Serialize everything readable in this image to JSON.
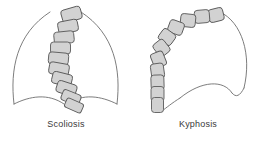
{
  "figure": {
    "type": "medical-illustration",
    "background_color": "#ffffff",
    "outline_color": "#6e6e6e",
    "vertebra_fill_color": "#d2d2d2",
    "vertebra_stroke_color": "#5a5a5a",
    "label_color": "#3a3a3a"
  },
  "panels": [
    {
      "id": "scoliosis",
      "label": "Scoliosis",
      "view": "anterior",
      "description": "Rib cage outline with lateral S-shaped curvature of the spine",
      "vertebra_count": 12,
      "body_outline_paths": [
        "M 14 104 C 10 70, 16 34, 50 12",
        "M 117 104 C 121 70, 115 34, 81 12",
        "M 14 104 C 30 96, 48 93, 64 104",
        "M 117 104 C 101 96, 83 93, 67 104"
      ],
      "vertebrae": [
        {
          "cx": 71.5,
          "cy": 14.5,
          "w": 20,
          "h": 13,
          "rot": -16
        },
        {
          "cx": 68.0,
          "cy": 26.5,
          "w": 20,
          "h": 12,
          "rot": -11
        },
        {
          "cx": 64.0,
          "cy": 37.5,
          "w": 20,
          "h": 12,
          "rot": -6
        },
        {
          "cx": 60.5,
          "cy": 48.0,
          "w": 20,
          "h": 12,
          "rot": 0
        },
        {
          "cx": 58.5,
          "cy": 58.5,
          "w": 20,
          "h": 12,
          "rot": 5
        },
        {
          "cx": 59.0,
          "cy": 69.0,
          "w": 20,
          "h": 12,
          "rot": 10
        },
        {
          "cx": 62.0,
          "cy": 79.0,
          "w": 20,
          "h": 12,
          "rot": 14
        },
        {
          "cx": 66.5,
          "cy": 88.5,
          "w": 20,
          "h": 12,
          "rot": 18
        },
        {
          "cx": 71.0,
          "cy": 97.5,
          "w": 19,
          "h": 11,
          "rot": 22
        },
        {
          "cx": 74.0,
          "cy": 105.5,
          "w": 18,
          "h": 10,
          "rot": 24
        }
      ]
    },
    {
      "id": "kyphosis",
      "label": "Kyphosis",
      "view": "lateral",
      "description": "Side view of torso with exaggerated forward rounding of the upper spine",
      "vertebra_count": 12,
      "body_outline_paths": [
        "M 88 12 C 110 22, 120 55, 112 88",
        "M 112 88 C 108 96, 104 98, 100 93",
        "M 100 93 C 92 80, 70 80, 48 98",
        "M 48 98 C 40 103, 34 108, 30 111",
        "M 30 111 C 28 108, 26 104, 25 100"
      ],
      "vertebrae": [
        {
          "cx": 84.0,
          "cy": 15.0,
          "w": 15,
          "h": 13,
          "rot": -14
        },
        {
          "cx": 70.0,
          "cy": 16.5,
          "w": 15,
          "h": 13,
          "rot": -5
        },
        {
          "cx": 56.0,
          "cy": 20.5,
          "w": 15,
          "h": 13,
          "rot": 6
        },
        {
          "cx": 44.0,
          "cy": 27.5,
          "w": 15,
          "h": 13,
          "rot": 20
        },
        {
          "cx": 35.0,
          "cy": 37.0,
          "w": 15,
          "h": 13,
          "rot": 36
        },
        {
          "cx": 29.5,
          "cy": 48.0,
          "w": 15,
          "h": 13,
          "rot": 52
        },
        {
          "cx": 26.5,
          "cy": 59.5,
          "w": 15,
          "h": 13,
          "rot": 68
        },
        {
          "cx": 25.5,
          "cy": 71.0,
          "w": 15,
          "h": 13,
          "rot": 82
        },
        {
          "cx": 25.5,
          "cy": 82.5,
          "w": 15,
          "h": 13,
          "rot": 88
        },
        {
          "cx": 25.5,
          "cy": 94.0,
          "w": 15,
          "h": 13,
          "rot": 90
        },
        {
          "cx": 25.5,
          "cy": 105.0,
          "w": 15,
          "h": 12,
          "rot": 90
        }
      ]
    }
  ]
}
